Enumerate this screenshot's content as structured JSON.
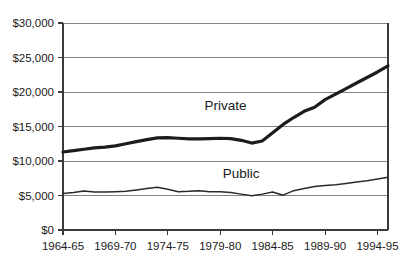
{
  "chart_data": {
    "type": "line",
    "title": "",
    "subtitle": "",
    "xlabel": "",
    "ylabel": "",
    "ylim": [
      0,
      30000
    ],
    "y_ticks": [
      0,
      5000,
      10000,
      15000,
      20000,
      25000,
      30000
    ],
    "y_tick_labels": [
      "$0",
      "$5,000",
      "$10,000",
      "$15,000",
      "$20,000",
      "$25,000",
      "$30,000"
    ],
    "x_tick_labels": [
      "1964-65",
      "1969-70",
      "1974-75",
      "1979-80",
      "1984-85",
      "1989-90",
      "1994-95"
    ],
    "x_tick_values": [
      1964,
      1969,
      1974,
      1979,
      1984,
      1989,
      1994
    ],
    "xlim": [
      1964,
      1995
    ],
    "grid": "horizontal",
    "legend": "inline-labels",
    "annotations": [
      {
        "text": "Private",
        "x": 1979.5,
        "y": 17400
      },
      {
        "text": "Public",
        "x": 1981.0,
        "y": 7600
      }
    ],
    "series": [
      {
        "name": "Private",
        "color": "#1c1c1c",
        "line_width": 3.2,
        "x": [
          1964,
          1965,
          1966,
          1967,
          1968,
          1969,
          1970,
          1971,
          1972,
          1973,
          1974,
          1975,
          1976,
          1977,
          1978,
          1979,
          1980,
          1981,
          1982,
          1983,
          1984,
          1985,
          1986,
          1987,
          1988,
          1989,
          1990,
          1991,
          1992,
          1993,
          1994,
          1995
        ],
        "values": [
          11300,
          11500,
          11700,
          11900,
          12000,
          12200,
          12500,
          12800,
          13100,
          13350,
          13400,
          13300,
          13200,
          13200,
          13250,
          13300,
          13250,
          13000,
          12600,
          12900,
          14100,
          15300,
          16300,
          17200,
          17800,
          18900,
          19700,
          20500,
          21300,
          22100,
          22900,
          23800
        ]
      },
      {
        "name": "Public",
        "color": "#2a2a2a",
        "line_width": 1.5,
        "x": [
          1964,
          1965,
          1966,
          1967,
          1968,
          1969,
          1970,
          1971,
          1972,
          1973,
          1974,
          1975,
          1976,
          1977,
          1978,
          1979,
          1980,
          1981,
          1982,
          1983,
          1984,
          1985,
          1986,
          1987,
          1988,
          1989,
          1990,
          1991,
          1992,
          1993,
          1994,
          1995
        ],
        "values": [
          5300,
          5450,
          5650,
          5500,
          5500,
          5550,
          5600,
          5800,
          6000,
          6200,
          5900,
          5550,
          5600,
          5700,
          5550,
          5550,
          5450,
          5200,
          4950,
          5200,
          5500,
          5050,
          5700,
          6000,
          6300,
          6450,
          6550,
          6750,
          6950,
          7150,
          7400,
          7650
        ]
      }
    ]
  },
  "plot_geometry": {
    "left": 63,
    "right": 388,
    "top": 23,
    "bottom": 230
  }
}
